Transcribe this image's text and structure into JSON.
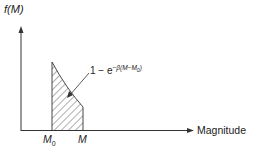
{
  "diagram": {
    "y_axis_label": "f(M)",
    "x_axis_label": "Magnitude",
    "tick_m0": "M",
    "tick_m0_sub": "0",
    "tick_m": "M",
    "curve_label": {
      "prefix": "1 − e",
      "exponent": "−β(M−M",
      "exponent_sub": "0",
      "exponent_close": ")"
    },
    "colors": {
      "ink": "#222222",
      "background": "#ffffff"
    }
  }
}
